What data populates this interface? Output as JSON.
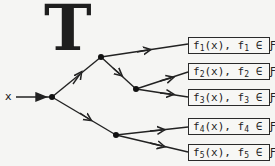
{
  "title": "T",
  "input_label": "x",
  "nodes": {
    "root": [
      52,
      97
    ],
    "upper": [
      101,
      57
    ],
    "mid": [
      136,
      89
    ],
    "lower": [
      116,
      135
    ]
  },
  "outputs": [
    {
      "f": "f",
      "sub": "1",
      "text_mid": "(x),  f",
      "text_end": " ∈ ∓",
      "label": "f1(x), f1 ∈ F"
    },
    {
      "f": "f",
      "sub": "2",
      "text_mid": "(x),  f",
      "text_end": " ∈ ∓",
      "label": "f2(x), f2 ∈ F"
    },
    {
      "f": "f",
      "sub": "3",
      "text_mid": "(x),  f",
      "text_end": " ∈ ∓",
      "label": "f3(x), f3 ∈ F"
    },
    {
      "f": "f",
      "sub": "4",
      "text_mid": "(x),  f",
      "text_end": " ∈ ∓",
      "label": "f4(x), f4 ∈ F"
    },
    {
      "f": "f",
      "sub": "5",
      "text_mid": "(x),  f",
      "text_end": " ∈ ∓",
      "label": "f5(x), f5 ∈ F"
    }
  ],
  "set_symbol": "Ƒ"
}
